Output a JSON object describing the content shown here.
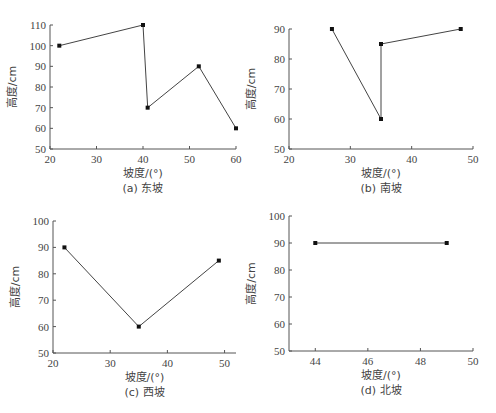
{
  "chart_data": [
    {
      "id": "a",
      "type": "line",
      "caption": "(a) 东坡",
      "xlabel": "坡度/(°)",
      "ylabel": "高度/cm",
      "xlim": [
        20,
        60
      ],
      "ylim": [
        50,
        110
      ],
      "xticks": [
        20,
        30,
        40,
        50,
        60
      ],
      "yticks": [
        50,
        60,
        70,
        80,
        90,
        100,
        110
      ],
      "grid": false,
      "x": [
        22,
        40,
        41,
        52,
        60
      ],
      "y": [
        100,
        110,
        70,
        90,
        60
      ]
    },
    {
      "id": "b",
      "type": "line",
      "caption": "(b) 南坡",
      "xlabel": "坡度/(°)",
      "ylabel": "高度/cm",
      "xlim": [
        20,
        50
      ],
      "ylim": [
        50,
        90
      ],
      "xticks": [
        20,
        30,
        40,
        50
      ],
      "yticks": [
        50,
        60,
        70,
        80,
        90
      ],
      "grid": false,
      "x": [
        27,
        35,
        35,
        48
      ],
      "y": [
        90,
        60,
        85,
        90
      ]
    },
    {
      "id": "c",
      "type": "line",
      "caption": "(c) 西坡",
      "xlabel": "坡度/(°)",
      "ylabel": "高度/cm",
      "xlim": [
        20,
        52
      ],
      "ylim": [
        50,
        100
      ],
      "xticks": [
        20,
        30,
        40,
        50
      ],
      "yticks": [
        50,
        60,
        70,
        80,
        90,
        100
      ],
      "grid": false,
      "x": [
        22,
        35,
        49
      ],
      "y": [
        90,
        60,
        85
      ]
    },
    {
      "id": "d",
      "type": "line",
      "caption": "(d) 北坡",
      "xlabel": "坡度/(°)",
      "ylabel": "高度/cm",
      "xlim": [
        43,
        50
      ],
      "ylim": [
        50,
        100
      ],
      "xticks": [
        44,
        46,
        48,
        50
      ],
      "yticks": [
        50,
        60,
        70,
        80,
        90,
        100
      ],
      "grid": false,
      "x": [
        44,
        49
      ],
      "y": [
        90,
        90
      ]
    }
  ]
}
